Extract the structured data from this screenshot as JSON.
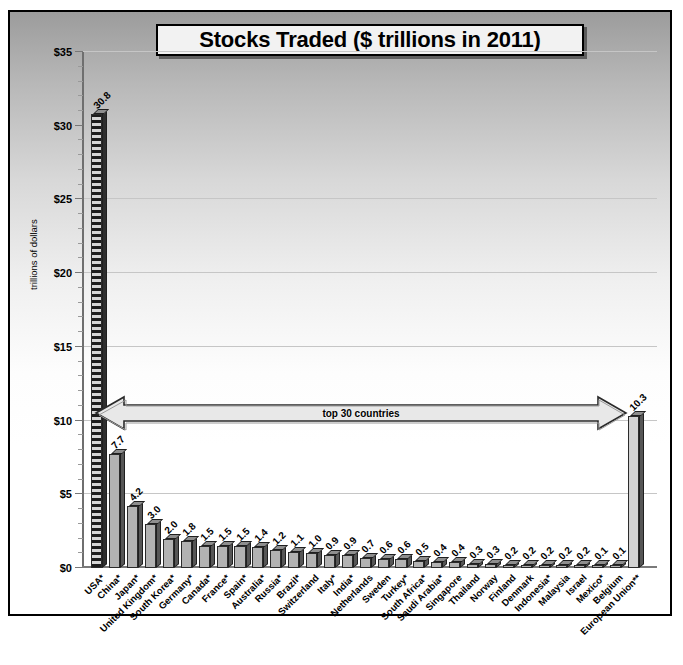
{
  "chart_data": {
    "type": "bar",
    "title": "Stocks Traded ($ trillions in 2011)",
    "xlabel": "",
    "ylabel": "trillions of dollars",
    "ylim": [
      0,
      35
    ],
    "ytick_labels": [
      "$0",
      "$5",
      "$10",
      "$15",
      "$20",
      "$25",
      "$30",
      "$35"
    ],
    "ytick_values": [
      0,
      5,
      10,
      15,
      20,
      25,
      30,
      35
    ],
    "grid": true,
    "legend": "none",
    "categories": [
      "USA*",
      "China*",
      "Japan*",
      "United Kingdom*",
      "South Korea*",
      "Germany*",
      "Canada*",
      "France*",
      "Spain*",
      "Australia*",
      "Russia*",
      "Brazil*",
      "Switzerland",
      "Italy*",
      "India*",
      "Netherlands",
      "Sweden",
      "Turkey*",
      "South Africa*",
      "Saudi Arabia*",
      "Singapore",
      "Thailand",
      "Norway",
      "Finland",
      "Denmark",
      "Indonesia*",
      "Malaysia",
      "Israel",
      "Mexico*",
      "Belgium",
      "European Union**"
    ],
    "values": [
      30.8,
      7.7,
      4.2,
      3.0,
      2.0,
      1.8,
      1.5,
      1.5,
      1.5,
      1.4,
      1.2,
      1.1,
      1.0,
      0.9,
      0.9,
      0.7,
      0.6,
      0.6,
      0.5,
      0.4,
      0.4,
      0.3,
      0.3,
      0.2,
      0.2,
      0.2,
      0.2,
      0.2,
      0.1,
      0.1,
      10.3
    ],
    "value_labels": [
      "30.8",
      "7.7",
      "4.2",
      "3.0",
      "2.0",
      "1.8",
      "1.5",
      "1.5",
      "1.5",
      "1.4",
      "1.2",
      "1.1",
      "1.0",
      "0.9",
      "0.9",
      "0.7",
      "0.6",
      "0.6",
      "0.5",
      "0.4",
      "0.4",
      "0.3",
      "0.3",
      "0.2",
      "0.2",
      "0.2",
      "0.2",
      "0.2",
      "0.1",
      "0.1",
      "10.3"
    ],
    "bar_styles": [
      "hatched",
      "solid",
      "solid",
      "solid",
      "solid",
      "solid",
      "solid",
      "solid",
      "solid",
      "solid",
      "solid",
      "solid",
      "solid",
      "solid",
      "solid",
      "solid",
      "solid",
      "solid",
      "solid",
      "solid",
      "solid",
      "solid",
      "solid",
      "solid",
      "solid",
      "solid",
      "solid",
      "solid",
      "solid",
      "solid",
      "light"
    ],
    "annotations": [
      {
        "text": "top 30 countries",
        "type": "double-headed-arrow",
        "from_category": "USA*",
        "to_category": "Belgium",
        "y_value": 10.5
      }
    ],
    "colors": {
      "bar_face": "#b2b2b2",
      "bar_face_light": "#d2d2d2",
      "bar_side": "#565656",
      "bar_hatch_dark": "#1c1c1c",
      "bar_outline": "#2b2b2b",
      "gridline": "#c6c6c6",
      "axis": "#6f6f6f",
      "title_bg": "#f2f2f2",
      "text": "#000000"
    }
  }
}
